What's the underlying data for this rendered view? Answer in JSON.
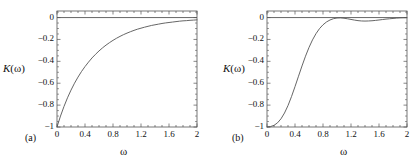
{
  "figure": {
    "background": "#ffffff",
    "line_color": "#555555",
    "axis_color": "#555555",
    "text_color": "#111111"
  },
  "chart_data": [
    {
      "type": "line",
      "panel_tag": "(a)",
      "title": "",
      "xlabel": "ω",
      "ylabel": "K(ω)",
      "ylabel_var": "K",
      "ylabel_arg": "(ω)",
      "xlim": [
        0,
        2
      ],
      "ylim": [
        -1.0,
        0.06
      ],
      "grid": false,
      "legend": "none",
      "xticks": [
        0,
        0.4,
        0.8,
        1.2,
        1.6,
        2
      ],
      "xticklabels": [
        "0",
        "0.4",
        "0.8",
        "1.2",
        "1.6",
        "2"
      ],
      "xminor_step": 0.1,
      "yticks": [
        0,
        -0.2,
        -0.4,
        -0.6,
        -0.8,
        -1
      ],
      "yticklabels": [
        "0",
        "−0.2",
        "−0.4",
        "−0.6",
        "−0.8",
        "−1"
      ],
      "zero_line": true,
      "series": [
        {
          "name": "K(ω) panel a",
          "x": [
            0.0,
            0.05,
            0.1,
            0.15,
            0.2,
            0.25,
            0.3,
            0.35,
            0.4,
            0.45,
            0.5,
            0.55,
            0.6,
            0.65,
            0.7,
            0.75,
            0.8,
            0.85,
            0.9,
            0.95,
            1.0,
            1.05,
            1.1,
            1.15,
            1.2,
            1.25,
            1.3,
            1.35,
            1.4,
            1.45,
            1.5,
            1.55,
            1.6,
            1.65,
            1.7,
            1.75,
            1.8,
            1.85,
            1.9,
            1.95,
            2.0
          ],
          "y": [
            -1.0,
            -0.9,
            -0.812,
            -0.733,
            -0.663,
            -0.6,
            -0.544,
            -0.493,
            -0.448,
            -0.407,
            -0.369,
            -0.336,
            -0.305,
            -0.277,
            -0.252,
            -0.229,
            -0.208,
            -0.189,
            -0.172,
            -0.156,
            -0.142,
            -0.129,
            -0.117,
            -0.106,
            -0.097,
            -0.088,
            -0.08,
            -0.072,
            -0.066,
            -0.06,
            -0.054,
            -0.049,
            -0.045,
            -0.041,
            -0.037,
            -0.033,
            -0.03,
            -0.028,
            -0.025,
            -0.023,
            -0.021
          ]
        }
      ]
    },
    {
      "type": "line",
      "panel_tag": "(b)",
      "title": "",
      "xlabel": "ω",
      "ylabel": "K(ω)",
      "ylabel_var": "K",
      "ylabel_arg": "(ω)",
      "xlim": [
        0,
        2
      ],
      "ylim": [
        -1.0,
        0.06
      ],
      "grid": false,
      "legend": "none",
      "xticks": [
        0,
        0.4,
        0.8,
        1.2,
        1.6,
        2
      ],
      "xticklabels": [
        "0",
        "0.4",
        "0.8",
        "1.2",
        "1.6",
        "2"
      ],
      "xminor_step": 0.1,
      "yticks": [
        0,
        -0.2,
        -0.4,
        -0.6,
        -0.8,
        -1
      ],
      "yticklabels": [
        "0",
        "−0.2",
        "−0.4",
        "−0.6",
        "−0.8",
        "−1"
      ],
      "zero_line": true,
      "series": [
        {
          "name": "K(ω) panel b",
          "x": [
            0.0,
            0.05,
            0.1,
            0.15,
            0.2,
            0.25,
            0.3,
            0.35,
            0.4,
            0.45,
            0.5,
            0.55,
            0.6,
            0.65,
            0.7,
            0.75,
            0.8,
            0.85,
            0.9,
            0.95,
            1.0,
            1.05,
            1.1,
            1.15,
            1.2,
            1.25,
            1.3,
            1.35,
            1.4,
            1.45,
            1.5,
            1.55,
            1.6,
            1.65,
            1.7,
            1.75,
            1.8,
            1.85,
            1.9,
            1.95,
            2.0
          ],
          "y": [
            -1.0,
            -0.996,
            -0.985,
            -0.962,
            -0.925,
            -0.872,
            -0.804,
            -0.722,
            -0.631,
            -0.536,
            -0.442,
            -0.353,
            -0.273,
            -0.204,
            -0.147,
            -0.101,
            -0.066,
            -0.04,
            -0.022,
            -0.01,
            -0.004,
            -0.003,
            -0.006,
            -0.011,
            -0.017,
            -0.023,
            -0.028,
            -0.031,
            -0.032,
            -0.031,
            -0.029,
            -0.026,
            -0.022,
            -0.018,
            -0.014,
            -0.011,
            -0.008,
            -0.005,
            -0.003,
            -0.002,
            -0.001
          ]
        }
      ]
    }
  ]
}
